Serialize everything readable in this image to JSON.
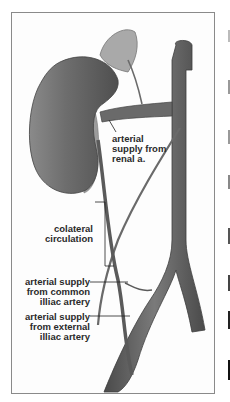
{
  "figure": {
    "labels": {
      "renal": [
        "arterial",
        "supply from",
        "renal a."
      ],
      "collateral": [
        "colateral",
        "circulation"
      ],
      "common_iliac": [
        "arterial supply",
        "from common",
        "illiac artery"
      ],
      "external_iliac": [
        "arterial supply",
        "from external",
        "illiac artery"
      ]
    }
  },
  "colors": {
    "organ": "#6a6a6a",
    "vessel": "#5e5e5e",
    "adrenal": "#a8a8a8",
    "border": "#8a8a8a",
    "text": "#2a2a2a"
  }
}
